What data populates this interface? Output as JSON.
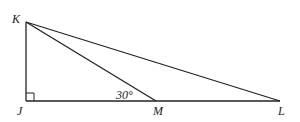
{
  "diagram": {
    "type": "geometry-triangle",
    "points": {
      "K": {
        "label": "K",
        "x": 26,
        "y": 22
      },
      "J": {
        "label": "J",
        "x": 26,
        "y": 101
      },
      "M": {
        "label": "M",
        "x": 156,
        "y": 101
      },
      "L": {
        "label": "L",
        "x": 280,
        "y": 101
      }
    },
    "segments": [
      "KJ",
      "JL",
      "KM",
      "KL"
    ],
    "right_angle_at": "J",
    "angle_label": {
      "text": "30°",
      "at": "M",
      "between": [
        "KM",
        "MJ"
      ]
    },
    "stroke_color": "#222222"
  }
}
